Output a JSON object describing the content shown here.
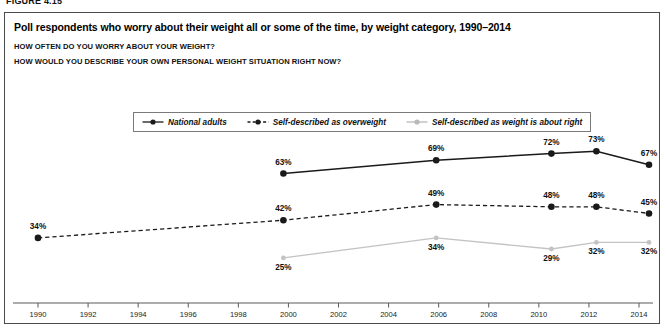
{
  "figure": {
    "label": "FIGURE 4.15",
    "title": "Poll respondents who worry about their weight all or some of the time, by weight category, 1990–2014",
    "subtitle_1": "HOW OFTEN DO YOU WORRY ABOUT YOUR WEIGHT?",
    "subtitle_2": "HOW WOULD YOU DESCRIBE YOUR OWN PERSONAL WEIGHT SITUATION RIGHT NOW?"
  },
  "legend": {
    "items": [
      {
        "label": "National adults",
        "style": "solid",
        "color": "#1a1a1a",
        "icon": "line-solid-marker-icon"
      },
      {
        "label": "Self-described as overweight",
        "style": "dashed",
        "color": "#1a1a1a",
        "icon": "line-dashed-marker-icon"
      },
      {
        "label": "Self-described as weight is about right",
        "style": "solid",
        "color": "#b9b9b9",
        "icon": "line-light-marker-icon"
      }
    ]
  },
  "chart_data": {
    "type": "line",
    "title": "Poll respondents who worry about their weight all or some of the time, by weight category, 1990–2014",
    "xlabel": "",
    "ylabel": "",
    "grid": false,
    "legend_position": "top-center",
    "xlim": [
      1989,
      2015
    ],
    "ylim": [
      20,
      80
    ],
    "xticks": [
      1990,
      1992,
      1994,
      1996,
      1998,
      2000,
      2002,
      2004,
      2006,
      2008,
      2010,
      2012,
      2014
    ],
    "xtick_labels": [
      "1990",
      "1992",
      "1994",
      "1996",
      "1998",
      "2000",
      "2002",
      "2004",
      "2006",
      "2008",
      "2010",
      "2012",
      "2014"
    ],
    "value_suffix": "%",
    "series": [
      {
        "name": "National adults",
        "color": "#1a1a1a",
        "style": "solid",
        "x": [
          1999.8,
          2005.9,
          2010.5,
          2012.3,
          2014.4
        ],
        "values": [
          63,
          69,
          72,
          73,
          67
        ],
        "labels": [
          "63%",
          "69%",
          "72%",
          "73%",
          "67%"
        ],
        "label_position": "above"
      },
      {
        "name": "Self-described as overweight",
        "color": "#1a1a1a",
        "style": "dashed",
        "x": [
          1990.0,
          1999.8,
          2005.9,
          2010.5,
          2012.3,
          2014.4
        ],
        "values": [
          34,
          42,
          49,
          48,
          48,
          45
        ],
        "labels": [
          "34%",
          "42%",
          "49%",
          "48%",
          "48%",
          "45%"
        ],
        "label_position": "above"
      },
      {
        "name": "Self-described as weight is about right",
        "color": "#c3c3c3",
        "style": "solid",
        "x": [
          1999.8,
          2005.9,
          2010.5,
          2012.3,
          2014.4
        ],
        "values": [
          25,
          34,
          29,
          32,
          32
        ],
        "labels": [
          "25%",
          "34%",
          "29%",
          "32%",
          "32%"
        ],
        "label_position": "below"
      }
    ]
  }
}
